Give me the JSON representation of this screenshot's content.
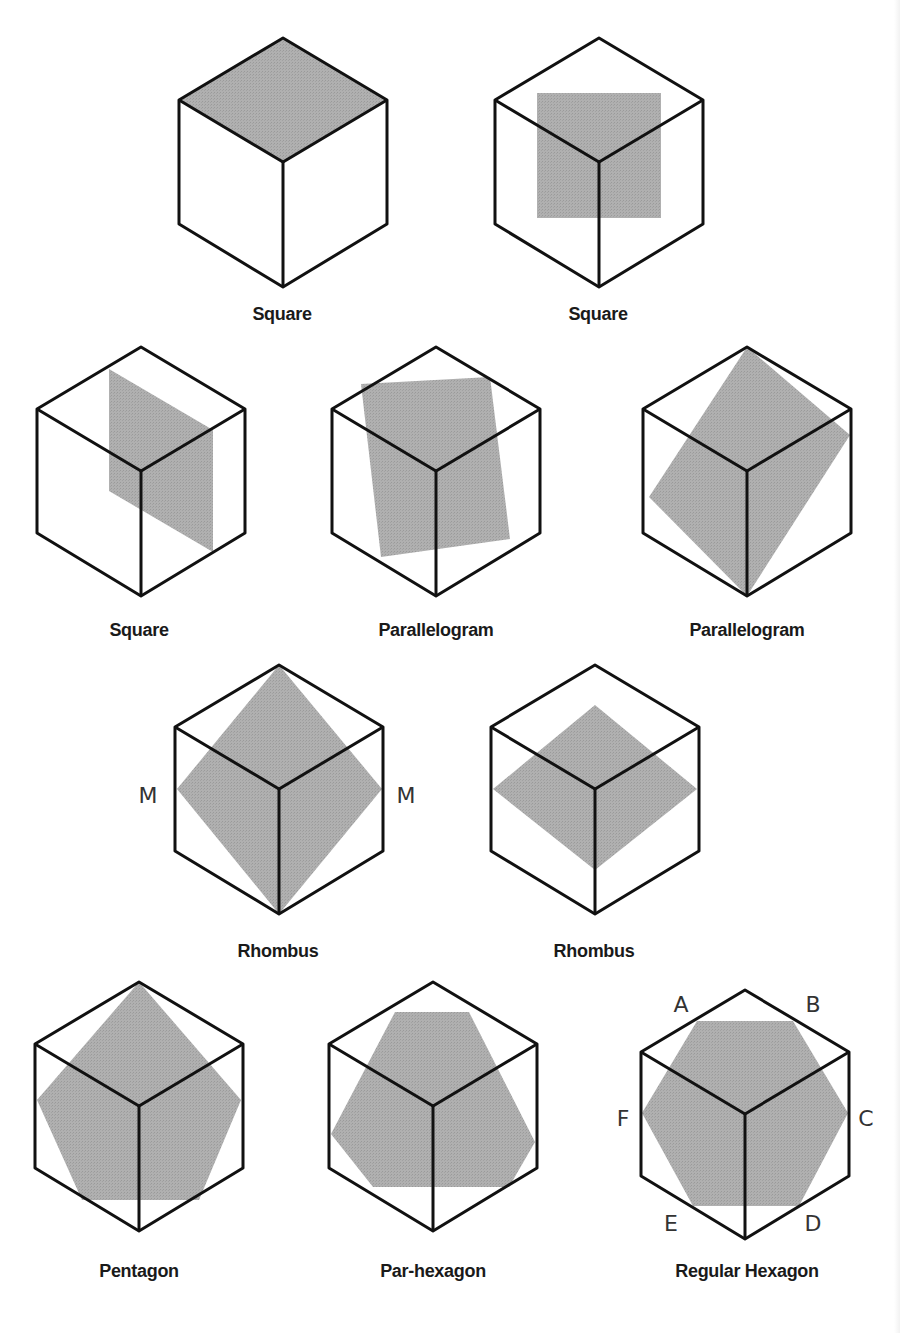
{
  "figure": {
    "colors": {
      "background": "#ffffff",
      "edge": "#111111",
      "shade": "#aaaaaa",
      "label": "#1a1a1a"
    },
    "cube_local": {
      "top": [
        0,
        0
      ],
      "upper_left": [
        -104,
        62
      ],
      "upper_right": [
        104,
        62
      ],
      "center": [
        0,
        124
      ],
      "lower_left": [
        -104,
        186
      ],
      "lower_right": [
        104,
        186
      ],
      "bottom": [
        0,
        249
      ]
    },
    "items": [
      {
        "caption": "Square",
        "origin": [
          283,
          38
        ],
        "caption_pos": [
          282,
          316
        ],
        "section": [
          [
            0,
            0
          ],
          [
            104,
            62
          ],
          [
            0,
            124
          ],
          [
            -104,
            62
          ]
        ]
      },
      {
        "caption": "Square",
        "origin": [
          599,
          38
        ],
        "caption_pos": [
          598,
          316
        ],
        "section": [
          [
            -62,
            55
          ],
          [
            62,
            55
          ],
          [
            62,
            180
          ],
          [
            -62,
            180
          ]
        ]
      },
      {
        "caption": "Square",
        "origin": [
          141,
          347
        ],
        "caption_pos": [
          139,
          632
        ],
        "section": [
          [
            -32,
            22
          ],
          [
            72,
            83
          ],
          [
            72,
            205
          ],
          [
            -32,
            144
          ]
        ]
      },
      {
        "caption": "Parallelogram",
        "origin": [
          436,
          347
        ],
        "caption_pos": [
          436,
          632
        ],
        "section": [
          [
            -75,
            37
          ],
          [
            54,
            30
          ],
          [
            74,
            192
          ],
          [
            -55,
            210
          ]
        ]
      },
      {
        "caption": "Parallelogram",
        "origin": [
          747,
          347
        ],
        "caption_pos": [
          747,
          632
        ],
        "section": [
          [
            0,
            0
          ],
          [
            103,
            88
          ],
          [
            0,
            249
          ],
          [
            -98,
            150
          ]
        ]
      },
      {
        "caption": "Rhombus",
        "origin": [
          279,
          665
        ],
        "caption_pos": [
          278,
          953
        ],
        "section": [
          [
            0,
            0
          ],
          [
            103,
            124
          ],
          [
            0,
            249
          ],
          [
            -102,
            124
          ]
        ]
      },
      {
        "caption": "Rhombus",
        "origin": [
          595,
          665
        ],
        "caption_pos": [
          594,
          953
        ],
        "section": [
          [
            0,
            40
          ],
          [
            102,
            124
          ],
          [
            0,
            205
          ],
          [
            -102,
            124
          ]
        ]
      },
      {
        "caption": "Pentagon",
        "origin": [
          139,
          982
        ],
        "caption_pos": [
          139,
          1273
        ],
        "section": [
          [
            0,
            0
          ],
          [
            102,
            118
          ],
          [
            60,
            218
          ],
          [
            -57,
            218
          ],
          [
            -102,
            118
          ]
        ]
      },
      {
        "caption": "Par-hexagon",
        "origin": [
          433,
          982
        ],
        "caption_pos": [
          433,
          1273
        ],
        "section": [
          [
            -38,
            30
          ],
          [
            36,
            30
          ],
          [
            102,
            160
          ],
          [
            76,
            205
          ],
          [
            -60,
            205
          ],
          [
            -102,
            152
          ]
        ]
      },
      {
        "caption": "Regular Hexagon",
        "origin": [
          745,
          990
        ],
        "caption_pos": [
          747,
          1273
        ],
        "section": [
          [
            -48,
            31
          ],
          [
            48,
            31
          ],
          [
            103,
            123
          ],
          [
            54,
            216
          ],
          [
            -52,
            216
          ],
          [
            -103,
            123
          ]
        ]
      }
    ],
    "vertex_labels": [
      {
        "text": "M",
        "pos": [
          148,
          795
        ]
      },
      {
        "text": "M",
        "pos": [
          406,
          795
        ]
      },
      {
        "text": "A",
        "pos": [
          681,
          1004
        ]
      },
      {
        "text": "B",
        "pos": [
          813,
          1004
        ]
      },
      {
        "text": "F",
        "pos": [
          623,
          1118
        ]
      },
      {
        "text": "C",
        "pos": [
          866,
          1118
        ]
      },
      {
        "text": "E",
        "pos": [
          671,
          1223
        ]
      },
      {
        "text": "D",
        "pos": [
          813,
          1223
        ]
      }
    ]
  }
}
